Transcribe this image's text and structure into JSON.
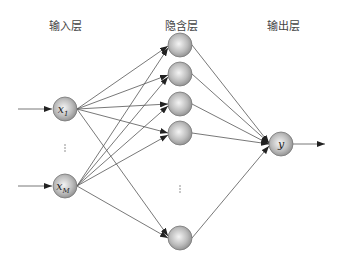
{
  "layers": {
    "input": {
      "label": "输入层",
      "nodes": [
        "x1",
        "xM"
      ],
      "sub": [
        "1",
        "M"
      ]
    },
    "hidden": {
      "label": "隐含层"
    },
    "output": {
      "label": "输出层",
      "node": "y"
    }
  },
  "ellipsis": "⋮"
}
